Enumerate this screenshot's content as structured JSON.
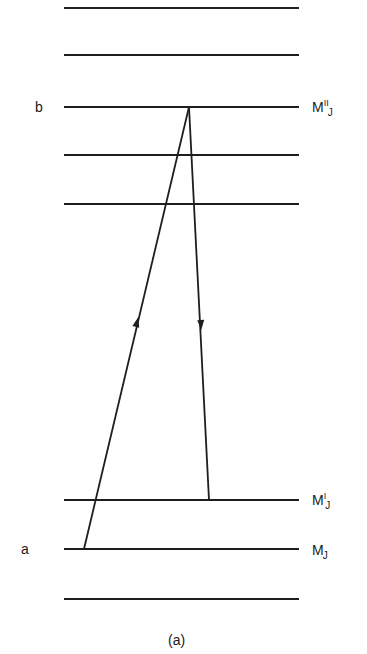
{
  "diagram": {
    "caption": "(a)",
    "stroke_color": "#1e1e1e",
    "levels": [
      {
        "y": 8,
        "label": null
      },
      {
        "y": 55,
        "label": null
      },
      {
        "y": 107,
        "label": "b",
        "right_label": {
          "base": "M",
          "sup": "II",
          "sub": "J"
        }
      },
      {
        "y": 155,
        "label": null
      },
      {
        "y": 204,
        "label": null
      },
      {
        "y": 500,
        "label": null,
        "right_label": {
          "base": "M",
          "sup": "I",
          "sub": "J"
        }
      },
      {
        "y": 549,
        "label": "a",
        "right_label": {
          "base": "M",
          "sup": "",
          "sub": "J"
        }
      },
      {
        "y": 599,
        "label": null
      }
    ],
    "level_x_start": 64,
    "level_x_end": 299,
    "transitions": [
      {
        "name": "absorption",
        "direction": "up",
        "from": [
          84,
          549
        ],
        "to": [
          189,
          107
        ],
        "arrow_at": [
          137,
          322
        ]
      },
      {
        "name": "emission",
        "direction": "down",
        "from": [
          189,
          107
        ],
        "to": [
          209,
          500
        ],
        "arrow_at": [
          201,
          325
        ]
      }
    ],
    "left_labels": {
      "b": "b",
      "a": "a"
    },
    "right_labels": {
      "upper": {
        "base": "M",
        "sup": "II",
        "sub": "J"
      },
      "middle": {
        "base": "M",
        "sup": "I",
        "sub": "J"
      },
      "lower": {
        "base": "M",
        "sup": "",
        "sub": "J"
      }
    }
  }
}
